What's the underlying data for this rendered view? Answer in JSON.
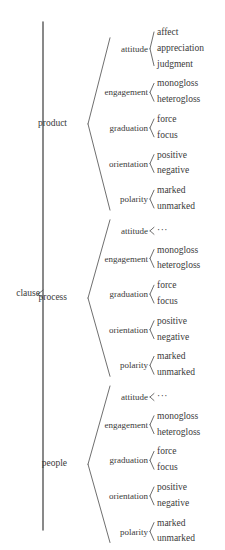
{
  "diagram": {
    "type": "system-network-tree",
    "root": {
      "label": "clause"
    },
    "branches": [
      {
        "label": "product",
        "systems": [
          {
            "label": "attitude",
            "leaves": [
              "affect",
              "appreciation",
              "judgment"
            ]
          },
          {
            "label": "engagement",
            "leaves": [
              "monogloss",
              "heterogloss"
            ]
          },
          {
            "label": "graduation",
            "leaves": [
              "force",
              "focus"
            ]
          },
          {
            "label": "orientation",
            "leaves": [
              "positive",
              "negative"
            ]
          },
          {
            "label": "polarity",
            "leaves": [
              "marked",
              "unmarked"
            ]
          }
        ]
      },
      {
        "label": "process",
        "systems": [
          {
            "label": "attitude",
            "leaves": [
              "···"
            ]
          },
          {
            "label": "engagement",
            "leaves": [
              "monogloss",
              "heterogloss"
            ]
          },
          {
            "label": "graduation",
            "leaves": [
              "force",
              "focus"
            ]
          },
          {
            "label": "orientation",
            "leaves": [
              "positive",
              "negative"
            ]
          },
          {
            "label": "polarity",
            "leaves": [
              "marked",
              "unmarked"
            ]
          }
        ]
      },
      {
        "label": "people",
        "systems": [
          {
            "label": "attitude",
            "leaves": [
              "···"
            ]
          },
          {
            "label": "engagement",
            "leaves": [
              "monogloss",
              "heterogloss"
            ]
          },
          {
            "label": "graduation",
            "leaves": [
              "force",
              "focus"
            ]
          },
          {
            "label": "orientation",
            "leaves": [
              "positive",
              "negative"
            ]
          },
          {
            "label": "polarity",
            "leaves": [
              "marked",
              "unmarked"
            ]
          }
        ]
      }
    ],
    "style": {
      "line_color": "#4a4a4a",
      "text_color": "#3a3a3a",
      "background": "#ffffff"
    }
  }
}
